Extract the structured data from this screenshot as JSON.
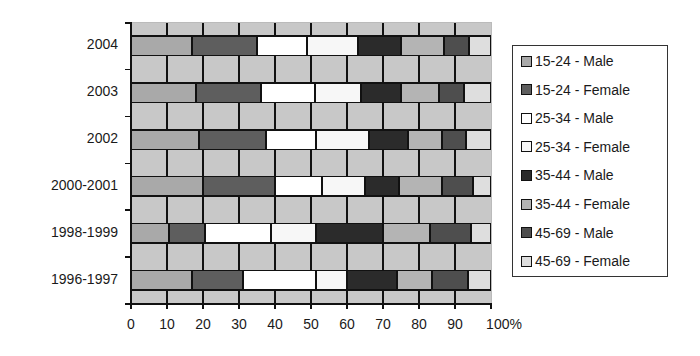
{
  "chart_data": {
    "type": "bar",
    "orientation": "horizontal",
    "stacked": "percent",
    "title": "",
    "xlabel": "",
    "ylabel": "",
    "xlim": [
      0,
      100
    ],
    "x_ticks": [
      "0",
      "10",
      "20",
      "30",
      "40",
      "50",
      "60",
      "70",
      "80",
      "90",
      "100%"
    ],
    "grid": true,
    "legend_position": "right",
    "categories": [
      "2004",
      "2003",
      "2002",
      "2000-2001",
      "1998-1999",
      "1996-1997"
    ],
    "series": [
      {
        "name": "15-24 - Male",
        "color": "#a9a9a9",
        "values": [
          17,
          18,
          19,
          20,
          10.5,
          17
        ]
      },
      {
        "name": "15-24 - Female",
        "color": "#5e5e5e",
        "values": [
          18,
          18,
          18.5,
          20,
          10,
          14
        ]
      },
      {
        "name": "25-34 - Male",
        "color": "#ffffff",
        "values": [
          14,
          15,
          14,
          13,
          18.5,
          20.5
        ]
      },
      {
        "name": "25-34 - Female",
        "color": "#f7f7f7",
        "values": [
          14,
          13,
          14.5,
          12,
          12.5,
          8.5
        ]
      },
      {
        "name": "35-44 - Male",
        "color": "#2b2b2b",
        "values": [
          12,
          11,
          11,
          9.5,
          18.5,
          14
        ]
      },
      {
        "name": "35-44 - Female",
        "color": "#b4b4b4",
        "values": [
          12,
          10.5,
          9.5,
          12,
          13,
          9.5
        ]
      },
      {
        "name": "45-69 - Male",
        "color": "#4e4e4e",
        "values": [
          7,
          7,
          6.5,
          8.5,
          11.5,
          10
        ]
      },
      {
        "name": "45-69 - Female",
        "color": "#dedede",
        "values": [
          6,
          7.5,
          7,
          5,
          5.5,
          6.5
        ]
      }
    ],
    "plot_background": "#c8c8c8"
  }
}
